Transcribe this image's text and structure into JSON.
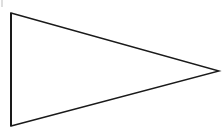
{
  "figure": {
    "shape_name": "triangle",
    "orientation": "right-pointing",
    "background_color": "#ffffff",
    "stroke_color": "#1a1a1a",
    "fill_color": "none",
    "stroke_width": 1.4,
    "canvas": {
      "width": 223,
      "height": 134
    },
    "vertices": [
      {
        "label": "top-left",
        "x": 11,
        "y": 13
      },
      {
        "label": "right-apex",
        "x": 219,
        "y": 71
      },
      {
        "label": "bottom-left",
        "x": 11,
        "y": 126
      }
    ],
    "edges": [
      {
        "name": "left-vertical-edge",
        "from": "top-left",
        "to": "bottom-left",
        "stroke_width": 2.0
      },
      {
        "name": "upper-slanted-edge",
        "from": "top-left",
        "to": "right-apex",
        "stroke_width": 1.4
      },
      {
        "name": "lower-slanted-edge",
        "from": "right-apex",
        "to": "bottom-left",
        "stroke_width": 1.4
      }
    ],
    "artifacts": [
      {
        "name": "corner-crop-sliver",
        "color": "#d8d8d8",
        "x": 1,
        "y": 0,
        "width": 2,
        "height": 7
      }
    ]
  }
}
